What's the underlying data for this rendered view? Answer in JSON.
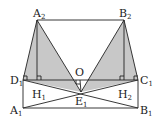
{
  "diagram": {
    "type": "geometry-figure",
    "colors": {
      "stroke": "#222222",
      "shade": "#c8c8c8",
      "background": "#ffffff"
    },
    "points": {
      "A2": {
        "label": "A",
        "sub": "2",
        "x": 37,
        "y": 20
      },
      "B2": {
        "label": "B",
        "sub": "2",
        "x": 124,
        "y": 20
      },
      "D1": {
        "label": "D",
        "sub": "1",
        "x": 23,
        "y": 80
      },
      "C1": {
        "label": "C",
        "sub": "1",
        "x": 138,
        "y": 80
      },
      "A1": {
        "label": "A",
        "sub": "1",
        "x": 23,
        "y": 108
      },
      "B1": {
        "label": "B",
        "sub": "1",
        "x": 138,
        "y": 108
      },
      "H1": {
        "label": "H",
        "sub": "1",
        "x": 37,
        "y": 80
      },
      "H2": {
        "label": "H",
        "sub": "2",
        "x": 124,
        "y": 80
      },
      "O": {
        "label": "O",
        "sub": "",
        "x": 80,
        "y": 80
      },
      "E1": {
        "label": "E",
        "sub": "1",
        "x": 81,
        "y": 92
      }
    },
    "labels": {
      "A2": "A",
      "A2_sub": "2",
      "B2": "B",
      "B2_sub": "2",
      "D1": "D",
      "D1_sub": "1",
      "C1": "C",
      "C1_sub": "1",
      "A1": "A",
      "A1_sub": "1",
      "B1": "B",
      "B1_sub": "1",
      "H1": "H",
      "H1_sub": "1",
      "H2": "H",
      "H2_sub": "2",
      "O": "O",
      "E1": "E",
      "E1_sub": "1"
    },
    "shaded_triangles": [
      [
        "A2",
        "D1",
        "E1"
      ],
      [
        "B2",
        "C1",
        "E1"
      ]
    ],
    "segments": [
      [
        "A2",
        "B2"
      ],
      [
        "A2",
        "D1"
      ],
      [
        "A2",
        "E1"
      ],
      [
        "A2",
        "H1"
      ],
      [
        "B2",
        "C1"
      ],
      [
        "B2",
        "E1"
      ],
      [
        "B2",
        "H2"
      ],
      [
        "D1",
        "C1"
      ],
      [
        "D1",
        "A1"
      ],
      [
        "C1",
        "B1"
      ],
      [
        "A1",
        "B1"
      ],
      [
        "D1",
        "E1"
      ],
      [
        "C1",
        "E1"
      ],
      [
        "A1",
        "E1"
      ],
      [
        "B1",
        "E1"
      ],
      [
        "D1",
        "B1"
      ],
      [
        "A1",
        "C1"
      ],
      [
        "O",
        "E1"
      ]
    ],
    "right_angle_marks": [
      "D1",
      "H1",
      "O",
      "H2",
      "C1"
    ]
  }
}
